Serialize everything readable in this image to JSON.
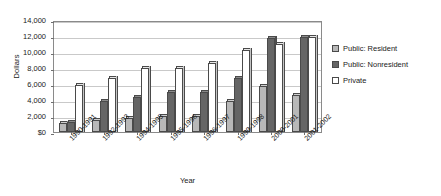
{
  "chart_data": {
    "type": "bar",
    "title": "",
    "xlabel": "Year",
    "ylabel": "Dollars",
    "ylim": [
      0,
      14000
    ],
    "ytick_labels": [
      "$0",
      "2,000",
      "4,000",
      "6,000",
      "8,000",
      "10,000",
      "12,000",
      "14,000"
    ],
    "ytick_values": [
      0,
      2000,
      4000,
      6000,
      8000,
      10000,
      12000,
      14000
    ],
    "grid": true,
    "legend_position": "right",
    "categories": [
      "1990-1991",
      "1992-1993",
      "1994-1995",
      "1995-1996",
      "1996-1997",
      "1999-1998",
      "2000-2001",
      "2001-2002"
    ],
    "series": [
      {
        "name": "Public: Resident",
        "color": "#b8b8b8",
        "values": [
          1100,
          1500,
          1750,
          2000,
          2000,
          3900,
          5800,
          4600
        ]
      },
      {
        "name": "Public: Nonresident",
        "color": "#656565",
        "values": [
          1300,
          3900,
          4400,
          5000,
          5000,
          6700,
          11700,
          11900
        ]
      },
      {
        "name": "Private",
        "color": "#ffffff",
        "values": [
          5900,
          6700,
          8000,
          8000,
          8600,
          10300,
          11000,
          11900
        ]
      }
    ]
  }
}
